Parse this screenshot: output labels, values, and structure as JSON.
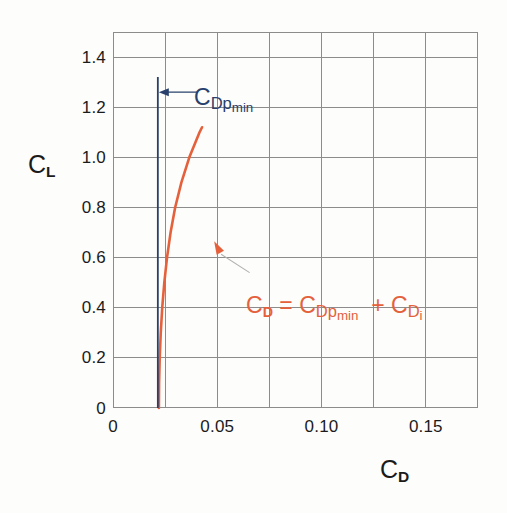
{
  "chart_data": {
    "type": "line",
    "title": "",
    "xlabel": "C_D",
    "ylabel": "C_L",
    "xlim": [
      0,
      0.175
    ],
    "ylim": [
      0,
      1.5
    ],
    "grid": true,
    "legend": null,
    "x_ticks": [
      {
        "value": 0,
        "label": "0"
      },
      {
        "value": 0.05,
        "label": "0.05"
      },
      {
        "value": 0.1,
        "label": "0.10"
      },
      {
        "value": 0.15,
        "label": "0.15"
      }
    ],
    "x_gridline_step": 0.025,
    "y_ticks": [
      {
        "value": 0,
        "label": "0"
      },
      {
        "value": 0.2,
        "label": "0.2"
      },
      {
        "value": 0.4,
        "label": "0.4"
      },
      {
        "value": 0.6,
        "label": "0.6"
      },
      {
        "value": 0.8,
        "label": "0.8"
      },
      {
        "value": 1.0,
        "label": "1.0"
      },
      {
        "value": 1.2,
        "label": "1.2"
      },
      {
        "value": 1.4,
        "label": "1.4"
      }
    ],
    "series": [
      {
        "name": "drag-polar-curve",
        "color": "#e4613c",
        "type": "line",
        "points": [
          [
            0.022,
            0.0
          ],
          [
            0.0221,
            0.1
          ],
          [
            0.0224,
            0.2
          ],
          [
            0.0229,
            0.3
          ],
          [
            0.0236,
            0.4
          ],
          [
            0.0246,
            0.5
          ],
          [
            0.0259,
            0.6
          ],
          [
            0.0276,
            0.7
          ],
          [
            0.0298,
            0.8
          ],
          [
            0.0328,
            0.9
          ],
          [
            0.0366,
            1.0
          ],
          [
            0.0415,
            1.1
          ],
          [
            0.0475,
            1.2
          ],
          [
            0.0548,
            1.3
          ],
          [
            0.0636,
            1.4
          ],
          [
            0.074,
            1.5
          ]
        ],
        "plotted_x_range": [
          0.022,
          0.105
        ],
        "plotted_y_range": [
          0.0,
          1.12
        ]
      },
      {
        "name": "cdpmin-vertical-line",
        "color": "#28406b",
        "type": "vline",
        "x": 0.0215,
        "y_from": 0.0,
        "y_to": 1.32
      }
    ],
    "annotations": [
      {
        "name": "cdpmin-label",
        "text": "C_Dp_min",
        "color": "#28406b",
        "at_x": 0.0405,
        "at_y": 1.26,
        "arrow_to_x": 0.0215,
        "arrow_to_y": 1.26
      },
      {
        "name": "drag-equation-label",
        "text": "C_D = C_Dp_min + C_Di",
        "color": "#e4613c",
        "at_x": 0.0655,
        "at_y": 0.44,
        "arrow_to_x": 0.0485,
        "arrow_to_y": 0.665
      }
    ]
  },
  "labels": {
    "y_axis_title_main": "C",
    "y_axis_title_sub": "L",
    "x_axis_title_main": "C",
    "x_axis_title_sub": "D",
    "cdpmin_c": "C",
    "cdpmin_d": "D",
    "cdpmin_p": "p",
    "cdpmin_min": "min",
    "eq_cd_c": "C",
    "eq_cd_d": "D",
    "eq_equals": "=",
    "eq_cdp_c": "C",
    "eq_cdp_d": "D",
    "eq_cdp_p": "p",
    "eq_cdp_min": "min",
    "eq_plus": "+",
    "eq_cdi_c": "C",
    "eq_cdi_d": "D",
    "eq_cdi_i": "i"
  },
  "colors": {
    "curve": "#e4613c",
    "vline": "#28406b",
    "grid": "#8c8c8c",
    "frame": "#8c8c8c",
    "text": "#1b1b1b",
    "background": "#fdfdfb"
  }
}
